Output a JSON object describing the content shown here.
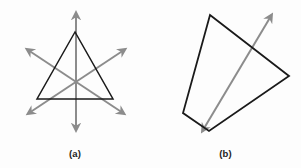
{
  "figure": {
    "background_color": "#fdfdfd",
    "shape_stroke_color": "#1a1a1a",
    "axis_stroke_color": "#8c8c8c",
    "caption_color": "#1c1c1c",
    "panels": [
      {
        "id": "a",
        "caption": "(a)",
        "shape_name": "equilateral-triangle",
        "shape_points": "75,32 37,99 113,99",
        "axes": [
          {
            "name": "vertical-symmetry-axis",
            "x1": 76,
            "y1": 14,
            "x2": 76,
            "y2": 129
          },
          {
            "name": "lower-left-to-upper-right-symmetry-axis",
            "x1": 29,
            "y1": 113,
            "x2": 124,
            "y2": 50
          },
          {
            "name": "upper-left-to-lower-right-symmetry-axis",
            "x1": 28,
            "y1": 50,
            "x2": 123,
            "y2": 113
          }
        ]
      },
      {
        "id": "b",
        "caption": "(b)",
        "shape_name": "irregular-arrow-polygon",
        "shape_points": "60,15 139,76 59,131 33,113",
        "axes": [
          {
            "name": "diagonal-line-through-figure",
            "x1": 53,
            "y1": 130,
            "x2": 121,
            "y2": 16
          }
        ]
      }
    ]
  }
}
